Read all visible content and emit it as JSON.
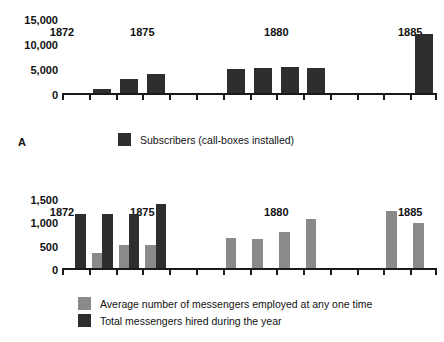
{
  "chart_data": [
    {
      "id": "A",
      "type": "bar",
      "title": "",
      "xlabel": "",
      "ylabel": "",
      "panel_letter": "A",
      "categories": [
        "1872",
        "1873",
        "1874",
        "1875",
        "1876",
        "1877",
        "1878",
        "1879",
        "1880",
        "1881",
        "1882",
        "1883",
        "1884",
        "1885"
      ],
      "tick_labels": {
        "1872": "1872",
        "1875": "1875",
        "1880": "1880",
        "1885": "1885"
      },
      "ylim": [
        0,
        15000
      ],
      "yticks": [
        0,
        5000,
        10000,
        15000
      ],
      "ytick_labels": [
        "0",
        "5,000",
        "10,000",
        "15,000"
      ],
      "grid": false,
      "legend_position": "bottom",
      "series": [
        {
          "name": "Subscribers (call-boxes installed)",
          "color": "#2e2e2e",
          "values": [
            0,
            800,
            2900,
            3900,
            0,
            0,
            4800,
            5100,
            5200,
            5100,
            0,
            0,
            0,
            11800
          ]
        }
      ]
    },
    {
      "id": "B",
      "type": "bar",
      "title": "",
      "xlabel": "",
      "ylabel": "",
      "panel_letter": "B",
      "categories": [
        "1872",
        "1873",
        "1874",
        "1875",
        "1876",
        "1877",
        "1878",
        "1879",
        "1880",
        "1881",
        "1882",
        "1883",
        "1884",
        "1885"
      ],
      "tick_labels": {
        "1872": "1872",
        "1875": "1875",
        "1880": "1880",
        "1885": "1885"
      },
      "ylim": [
        0,
        1500
      ],
      "yticks": [
        0,
        500,
        1000,
        1500
      ],
      "ytick_labels": [
        "0",
        "500",
        "1,000",
        "1,500"
      ],
      "grid": false,
      "legend_position": "bottom",
      "series": [
        {
          "name": "Average number of messengers employed at any one time",
          "color": "#8a8a8a",
          "values": [
            0,
            320,
            500,
            500,
            0,
            0,
            650,
            620,
            780,
            1040,
            0,
            0,
            1220,
            960
          ]
        },
        {
          "name": "Total messengers hired during the year",
          "color": "#2e2e2e",
          "values": [
            1160,
            1160,
            1160,
            1380,
            0,
            0,
            0,
            0,
            0,
            0,
            0,
            0,
            0,
            0
          ]
        }
      ]
    }
  ],
  "panel_a": {
    "letter": "A",
    "ylabels": [
      "15,000",
      "10,000",
      "5,000",
      "0"
    ],
    "xlabels": [
      "1872",
      "1875",
      "1880",
      "1885"
    ],
    "legend": [
      {
        "label": "Subscribers (call-boxes installed)",
        "swatch": "dark"
      }
    ]
  },
  "panel_b": {
    "letter": "B",
    "ylabels": [
      "1,500",
      "1,000",
      "500",
      "0"
    ],
    "xlabels": [
      "1872",
      "1875",
      "1880",
      "1885"
    ],
    "legend": [
      {
        "label": "Average number of messengers employed at any one time",
        "swatch": "light"
      },
      {
        "label": "Total messengers hired during the year",
        "swatch": "dark"
      }
    ]
  },
  "colors": {
    "dark_series": "#2e2e2e",
    "light_series": "#8a8a8a",
    "axis": "#1a1a1a",
    "background": "#ffffff"
  }
}
